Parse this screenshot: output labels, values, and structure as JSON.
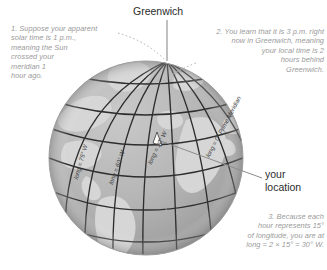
{
  "figure": {
    "type": "globe-longitude-diagram",
    "background": "#ffffff"
  },
  "colors": {
    "ocean": "#b4b4b4",
    "land": "#d5d5d5",
    "grid": "#2e2e2e",
    "annotation_text": "#9a9a9a",
    "plain_text": "#2b2b2b",
    "leader_line": "#8c8c8c",
    "meridian_label": "#3a3a3a"
  },
  "labels": {
    "greenwich": "Greenwich",
    "your_location": "your\nlocation"
  },
  "annotations": [
    {
      "id": "step-1",
      "text": "1. Suppose your apparent\nsolar time is 1 p.m.,\nmeaning the Sun\ncrossed your\nmeridian 1\nhour ago."
    },
    {
      "id": "step-2",
      "text": "2. You learn that it is 3 p.m. right\nnow in Greenwich, meaning\nyour local time is 2\nhours behind\nGreenwich."
    },
    {
      "id": "step-3",
      "text": "3. Because each\nhour represents 15°\nof longitude, you are at\nlong = 2 × 15° = 30° W."
    }
  ],
  "meridian_labels": [
    {
      "id": "m75",
      "text": "long = 75° W"
    },
    {
      "id": "m60",
      "text": "long = 60° W"
    },
    {
      "id": "m30",
      "text": "long = 30° W"
    },
    {
      "id": "m0",
      "text": "long = 0° Prime Meridian"
    }
  ]
}
